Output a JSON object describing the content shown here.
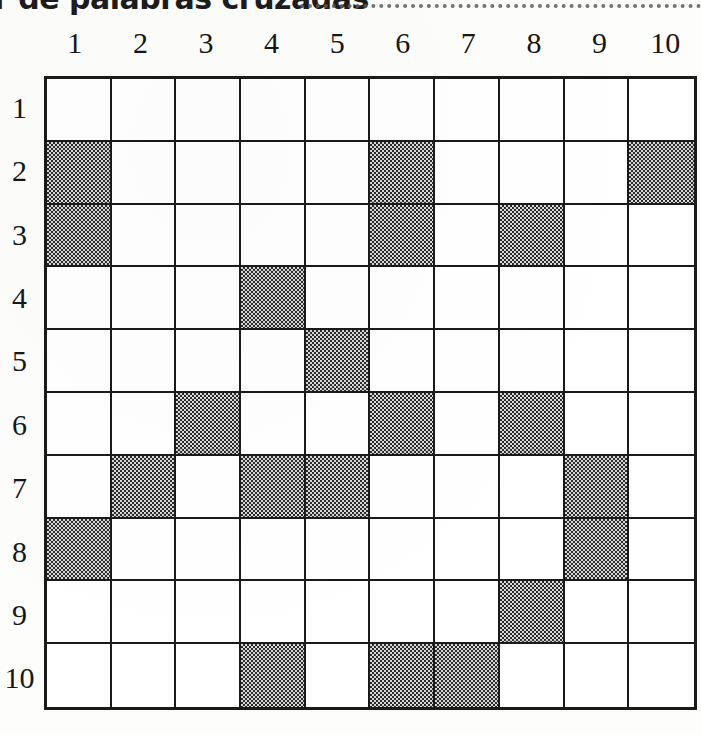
{
  "page": {
    "title_fragment": "r de palabras cruzadas",
    "title_rule": "dotted-rule"
  },
  "grid": {
    "rows": 10,
    "columns": 10,
    "column_headers": [
      "1",
      "2",
      "3",
      "4",
      "5",
      "6",
      "7",
      "8",
      "9",
      "10"
    ],
    "row_headers": [
      "1",
      "2",
      "3",
      "4",
      "5",
      "6",
      "7",
      "8",
      "9",
      "10"
    ],
    "shaded_color": "#8a8a8a",
    "line_color": "#1a1a1a",
    "cell_fill_color": "#ffffff",
    "shaded_cells": [
      {
        "row": 2,
        "col": 1
      },
      {
        "row": 2,
        "col": 6
      },
      {
        "row": 2,
        "col": 10
      },
      {
        "row": 3,
        "col": 1
      },
      {
        "row": 3,
        "col": 6
      },
      {
        "row": 3,
        "col": 8
      },
      {
        "row": 4,
        "col": 4
      },
      {
        "row": 5,
        "col": 5
      },
      {
        "row": 6,
        "col": 3
      },
      {
        "row": 6,
        "col": 6
      },
      {
        "row": 6,
        "col": 8
      },
      {
        "row": 7,
        "col": 2
      },
      {
        "row": 7,
        "col": 4
      },
      {
        "row": 7,
        "col": 5
      },
      {
        "row": 7,
        "col": 9
      },
      {
        "row": 8,
        "col": 1
      },
      {
        "row": 8,
        "col": 9
      },
      {
        "row": 9,
        "col": 8
      },
      {
        "row": 10,
        "col": 4
      },
      {
        "row": 10,
        "col": 6
      },
      {
        "row": 10,
        "col": 7
      }
    ],
    "shaded_by_row": [
      [],
      [
        1,
        6,
        10
      ],
      [
        1,
        6,
        8
      ],
      [
        4
      ],
      [
        5
      ],
      [
        3,
        6,
        8
      ],
      [
        2,
        4,
        5,
        9
      ],
      [
        1,
        9
      ],
      [
        8
      ],
      [
        4,
        6,
        7
      ]
    ]
  }
}
